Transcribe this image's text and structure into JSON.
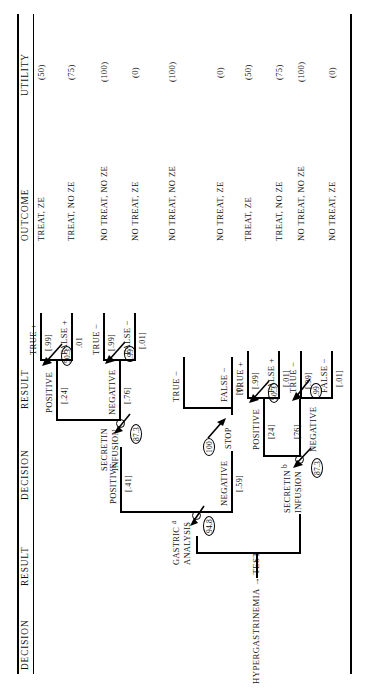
{
  "figure": {
    "type": "decision-tree",
    "root_label": "HYPERGASTRINEMIA → TEST",
    "columns": [
      "DECISION",
      "RESULT",
      "DECISION",
      "RESULT",
      "OUTCOME",
      "UTILITY"
    ]
  },
  "columns": {
    "c1": "DECISION",
    "c2": "RESULT",
    "c3": "DECISION",
    "c4": "RESULT",
    "c5": "OUTCOME",
    "c6": "UTILITY"
  },
  "nodes": {
    "gastric": {
      "label_line1": "GASTRIC",
      "label_line2": "ANALYSIS",
      "superscript": "a",
      "value": "94.8"
    },
    "secretin_top": {
      "label_line1": "SECRETIN",
      "label_line2": "INFUSION",
      "value": "87.3"
    },
    "stop": {
      "label": "STOP",
      "value": "100"
    },
    "secretin_bottom": {
      "label_line1": "SECRETIN",
      "label_line2": "INFUSION",
      "superscript": "b",
      "value": "87.3"
    }
  },
  "branches": {
    "gastric_positive": {
      "label": "POSITIVE",
      "prob": "[.41]"
    },
    "gastric_negative": {
      "label": "NEGATIVE",
      "prob": "[.59]"
    },
    "sec_top_positive": {
      "label": "POSITIVE",
      "prob": "[.24]",
      "ev": "50.3"
    },
    "sec_top_negative": {
      "label": "NEGATIVE",
      "prob": "[.76]",
      "ev": ".99"
    },
    "sec_bot_positive": {
      "label": "POSITIVE",
      "prob": "[24]",
      "ev": "50.3"
    },
    "sec_bot_negative": {
      "label": "NEGATIVE",
      "prob": "[76]",
      "ev": ".99"
    }
  },
  "results": [
    {
      "id": "r1",
      "label": "TRUE +",
      "prob": "[.99]"
    },
    {
      "id": "r2",
      "label": "FALSE +",
      "prob": ".01"
    },
    {
      "id": "r3",
      "label": "TRUE −",
      "prob": "[.99]"
    },
    {
      "id": "r4",
      "label": "FALSE −",
      "prob": "[.01]"
    },
    {
      "id": "r5",
      "label": "TRUE −",
      "prob": ""
    },
    {
      "id": "r6",
      "label": "FALSE −",
      "prob": "[0]"
    },
    {
      "id": "r7",
      "label": "TRUE +",
      "prob": "[.99]"
    },
    {
      "id": "r8",
      "label": "FALSE +",
      "prob": "[.01]"
    },
    {
      "id": "r9",
      "label": "TRUE −",
      "prob": "[.99]"
    },
    {
      "id": "r10",
      "label": "FALSE −",
      "prob": "[.01]"
    }
  ],
  "outcomes": [
    {
      "id": "o1",
      "outcome": "TREAT, ZE",
      "utility": "(50)"
    },
    {
      "id": "o2",
      "outcome": "TREAT, NO ZE",
      "utility": "(75)"
    },
    {
      "id": "o3",
      "outcome": "NO TREAT, NO ZE",
      "utility": "(100)"
    },
    {
      "id": "o4",
      "outcome": "NO TREAT, ZE",
      "utility": "(0)"
    },
    {
      "id": "o5",
      "outcome": "NO TREAT, NO ZE",
      "utility": "(100)"
    },
    {
      "id": "o6",
      "outcome": "NO TREAT, ZE",
      "utility": "(0)"
    },
    {
      "id": "o7",
      "outcome": "TREAT, ZE",
      "utility": "(50)"
    },
    {
      "id": "o8",
      "outcome": "TREAT, NO ZE",
      "utility": "(75)"
    },
    {
      "id": "o9",
      "outcome": "NO TREAT, NO ZE",
      "utility": "(100)"
    },
    {
      "id": "o10",
      "outcome": "NO TREAT, ZE",
      "utility": "(0)"
    }
  ],
  "colors": {
    "ink": "#111111",
    "paper": "#ffffff"
  }
}
